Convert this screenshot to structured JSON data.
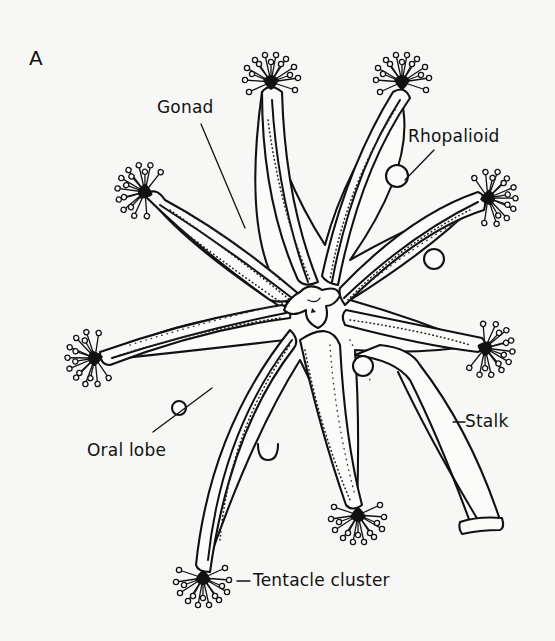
{
  "figure": {
    "panel_label": "A",
    "labels": {
      "gonad": "Gonad",
      "rhopalioid": "Rhopalioid",
      "oral_lobe": "Oral lobe",
      "stalk": "Stalk",
      "tentacle_cluster": "Tentacle cluster"
    },
    "colors": {
      "ink": "#111111",
      "paper": "#f7f7f5"
    },
    "tentacle_clusters": [
      {
        "id": "top-left",
        "x": 271,
        "y": 82
      },
      {
        "id": "top-right",
        "x": 402,
        "y": 82
      },
      {
        "id": "left-upper",
        "x": 145,
        "y": 192
      },
      {
        "id": "right-upper",
        "x": 488,
        "y": 198
      },
      {
        "id": "left-lower",
        "x": 95,
        "y": 358
      },
      {
        "id": "right-lower",
        "x": 485,
        "y": 348
      },
      {
        "id": "bottom-center",
        "x": 358,
        "y": 515
      },
      {
        "id": "bottom-left",
        "x": 203,
        "y": 578
      }
    ]
  }
}
